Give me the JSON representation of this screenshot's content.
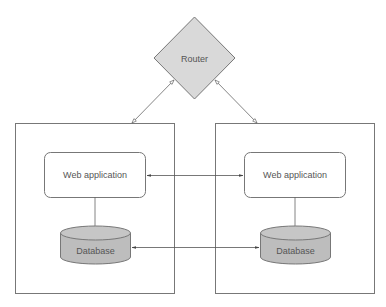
{
  "diagram": {
    "router": {
      "label": "Router",
      "fill": "#d9d9d9"
    },
    "left_node": {
      "webapp_label": "Web application",
      "database_label": "Database"
    },
    "right_node": {
      "webapp_label": "Web application",
      "database_label": "Database"
    },
    "colors": {
      "stroke": "#666666",
      "db_fill": "#bdbdbd",
      "db_top": "#c8c8c8",
      "text": "#555555"
    },
    "connections": [
      {
        "from": "router",
        "to": "left_node",
        "type": "bidirectional-open-arrow"
      },
      {
        "from": "router",
        "to": "right_node",
        "type": "bidirectional-open-arrow"
      },
      {
        "from": "left_webapp",
        "to": "right_webapp",
        "type": "bidirectional-arrow"
      },
      {
        "from": "left_database",
        "to": "right_database",
        "type": "bidirectional-arrow"
      },
      {
        "from": "left_webapp",
        "to": "left_database",
        "type": "line"
      },
      {
        "from": "right_webapp",
        "to": "right_database",
        "type": "line"
      }
    ]
  }
}
